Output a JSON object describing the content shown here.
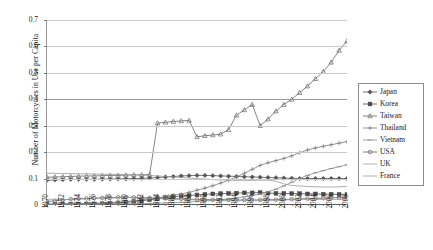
{
  "chart_data": {
    "type": "line",
    "title": "",
    "xlabel": "",
    "ylabel": "Number of Motorcycles in Use per Capita",
    "ylim": [
      0,
      0.7
    ],
    "ytick_labels": [
      "0",
      "0.1",
      "0.2",
      "0.3",
      "0.4",
      "0.5",
      "0.6",
      "0.7"
    ],
    "ytick_values": [
      0,
      0.1,
      0.2,
      0.3,
      0.4,
      0.5,
      0.6,
      0.7
    ],
    "grid": true,
    "legend_position": "right",
    "x": [
      1970,
      1971,
      1972,
      1973,
      1974,
      1975,
      1976,
      1977,
      1978,
      1979,
      1980,
      1981,
      1982,
      1983,
      1984,
      1985,
      1986,
      1987,
      1988,
      1989,
      1990,
      1991,
      1992,
      1993,
      1994,
      1995,
      1996,
      1997,
      1998,
      1999,
      2000,
      2001,
      2002,
      2003,
      2004,
      2005,
      2006,
      2007,
      2008
    ],
    "xtick_labels": [
      "1970",
      "1972",
      "1974",
      "1976",
      "1978",
      "1980",
      "1982",
      "1984",
      "1986",
      "1988",
      "1990",
      "1992",
      "1994",
      "1996",
      "1998",
      "2000",
      "2002",
      "2004",
      "2006",
      "2008"
    ],
    "xtick_values": [
      1970,
      1972,
      1974,
      1976,
      1978,
      1980,
      1982,
      1984,
      1986,
      1988,
      1990,
      1992,
      1994,
      1996,
      1998,
      2000,
      2002,
      2004,
      2006,
      2008
    ],
    "series": [
      {
        "name": "Japan",
        "marker": "diamond",
        "color": "#555555",
        "values": [
          0.094,
          0.095,
          0.096,
          0.097,
          0.097,
          0.097,
          0.097,
          0.098,
          0.098,
          0.099,
          0.099,
          0.1,
          0.101,
          0.102,
          0.104,
          0.106,
          0.108,
          0.11,
          0.111,
          0.112,
          0.112,
          0.111,
          0.11,
          0.109,
          0.108,
          0.107,
          0.106,
          0.105,
          0.104,
          0.103,
          0.102,
          0.101,
          0.1,
          0.1,
          0.1,
          0.1,
          0.1,
          0.1,
          0.1
        ]
      },
      {
        "name": "Korea",
        "marker": "square",
        "color": "#4a4a4a",
        "values": [
          0.002,
          0.002,
          0.003,
          0.003,
          0.003,
          0.004,
          0.004,
          0.005,
          0.006,
          0.008,
          0.01,
          0.013,
          0.016,
          0.02,
          0.024,
          0.028,
          0.031,
          0.034,
          0.036,
          0.038,
          0.04,
          0.042,
          0.043,
          0.044,
          0.045,
          0.046,
          0.046,
          0.047,
          0.045,
          0.044,
          0.044,
          0.043,
          0.043,
          0.042,
          0.042,
          0.041,
          0.041,
          0.04,
          0.04
        ]
      },
      {
        "name": "Taiwan",
        "marker": "triangle",
        "color": "#666666",
        "values": [
          0.105,
          0.106,
          0.107,
          0.108,
          0.109,
          0.11,
          0.11,
          0.111,
          0.112,
          0.112,
          0.113,
          0.114,
          0.114,
          0.115,
          0.31,
          0.313,
          0.316,
          0.318,
          0.32,
          0.258,
          0.262,
          0.265,
          0.268,
          0.285,
          0.34,
          0.36,
          0.38,
          0.3,
          0.325,
          0.355,
          0.38,
          0.4,
          0.425,
          0.45,
          0.478,
          0.505,
          0.54,
          0.585,
          0.62
        ]
      },
      {
        "name": "Thailand",
        "marker": "cross",
        "color": "#7a7a7a",
        "values": [
          0.004,
          0.004,
          0.005,
          0.005,
          0.006,
          0.006,
          0.007,
          0.008,
          0.009,
          0.011,
          0.013,
          0.016,
          0.019,
          0.023,
          0.027,
          0.032,
          0.037,
          0.042,
          0.048,
          0.056,
          0.064,
          0.073,
          0.083,
          0.094,
          0.106,
          0.12,
          0.135,
          0.15,
          0.16,
          0.168,
          0.176,
          0.186,
          0.198,
          0.208,
          0.216,
          0.222,
          0.228,
          0.234,
          0.24
        ]
      },
      {
        "name": "Vietnam",
        "marker": "dash",
        "color": "#8a8a8a",
        "values": [
          0.002,
          0.002,
          0.002,
          0.002,
          0.002,
          0.002,
          0.003,
          0.003,
          0.003,
          0.004,
          0.004,
          0.005,
          0.005,
          0.006,
          0.007,
          0.008,
          0.009,
          0.01,
          0.011,
          0.013,
          0.015,
          0.017,
          0.02,
          0.023,
          0.027,
          0.031,
          0.036,
          0.042,
          0.05,
          0.06,
          0.072,
          0.086,
          0.1,
          0.112,
          0.122,
          0.13,
          0.138,
          0.145,
          0.152
        ]
      },
      {
        "name": "USA",
        "marker": "circle",
        "color": "#5e5e5e",
        "values": [
          0.013,
          0.016,
          0.019,
          0.022,
          0.024,
          0.025,
          0.026,
          0.027,
          0.028,
          0.029,
          0.03,
          0.029,
          0.028,
          0.027,
          0.026,
          0.025,
          0.024,
          0.023,
          0.022,
          0.021,
          0.02,
          0.02,
          0.019,
          0.019,
          0.019,
          0.019,
          0.019,
          0.019,
          0.02,
          0.02,
          0.021,
          0.022,
          0.023,
          0.024,
          0.025,
          0.026,
          0.027,
          0.028,
          0.028
        ]
      },
      {
        "name": "UK",
        "marker": "line",
        "color": "#a0a0a0",
        "values": [
          0.022,
          0.021,
          0.021,
          0.021,
          0.022,
          0.023,
          0.024,
          0.025,
          0.026,
          0.027,
          0.028,
          0.027,
          0.026,
          0.025,
          0.024,
          0.023,
          0.022,
          0.021,
          0.02,
          0.019,
          0.018,
          0.017,
          0.016,
          0.016,
          0.016,
          0.016,
          0.016,
          0.017,
          0.017,
          0.018,
          0.019,
          0.02,
          0.02,
          0.021,
          0.021,
          0.021,
          0.021,
          0.021,
          0.021
        ]
      },
      {
        "name": "France",
        "marker": "line",
        "color": "#999999",
        "values": [
          0.12,
          0.12,
          0.119,
          0.119,
          0.118,
          0.118,
          0.117,
          0.117,
          0.116,
          0.116,
          0.115,
          0.114,
          0.113,
          0.112,
          0.11,
          0.108,
          0.106,
          0.104,
          0.102,
          0.1,
          0.098,
          0.096,
          0.095,
          0.094,
          0.093,
          0.093,
          0.093,
          0.094,
          0.094,
          0.09,
          0.08,
          0.074,
          0.072,
          0.07,
          0.069,
          0.068,
          0.068,
          0.069,
          0.07
        ]
      }
    ]
  },
  "legend": {
    "items": [
      {
        "label": "Japan"
      },
      {
        "label": "Korea"
      },
      {
        "label": "Taiwan"
      },
      {
        "label": "Thailand"
      },
      {
        "label": "Vietnam"
      },
      {
        "label": "USA"
      },
      {
        "label": "UK"
      },
      {
        "label": "France"
      }
    ]
  }
}
